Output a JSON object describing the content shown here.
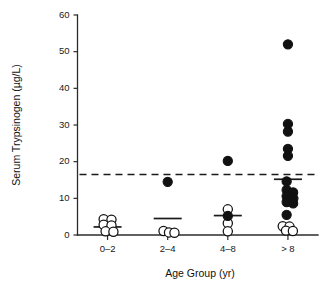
{
  "figure": {
    "width": 330,
    "height": 286,
    "background": "#ffffff",
    "ink_color": "#111111"
  },
  "chart_data": {
    "type": "scatter",
    "title": "",
    "subtitle": "",
    "xlabel": "Age Group (yr)",
    "ylabel": "Serum Trypsinogen (µg/L)",
    "categories": [
      "0–2",
      "2–4",
      "4–8",
      "> 8"
    ],
    "ylim": [
      0,
      60
    ],
    "yticks": [
      0,
      10,
      20,
      30,
      40,
      50,
      60
    ],
    "ytick_labels": [
      "0",
      "10",
      "20",
      "30",
      "40",
      "50",
      "60"
    ],
    "grid": false,
    "legend": "none",
    "marker_styles": {
      "open": "open circle (white fill, black outline)",
      "filled": "filled black circle"
    },
    "annotations": [
      {
        "name": "threshold-line",
        "kind": "horizontal-dashed-line",
        "value": 16.5,
        "style": "dashed",
        "color": "#1a1a1a"
      }
    ],
    "group_means": [
      {
        "category": "0–2",
        "mean": 2.2
      },
      {
        "category": "2–4",
        "mean": 4.5
      },
      {
        "category": "4–8",
        "mean": 5.3
      },
      {
        "category": "> 8",
        "mean": 15.2
      }
    ],
    "series": [
      {
        "name": "0–2",
        "category_index": 0,
        "points": [
          {
            "value": 4.3,
            "marker": "open",
            "jitter": -0.3
          },
          {
            "value": 4.2,
            "marker": "open",
            "jitter": 0.3
          },
          {
            "value": 2.8,
            "marker": "open",
            "jitter": -0.3
          },
          {
            "value": 2.6,
            "marker": "open",
            "jitter": 0.3
          },
          {
            "value": 1.0,
            "marker": "open",
            "jitter": -0.15
          },
          {
            "value": 0.9,
            "marker": "open",
            "jitter": 0.45
          }
        ]
      },
      {
        "name": "2–4",
        "category_index": 1,
        "points": [
          {
            "value": 14.5,
            "marker": "filled",
            "jitter": 0.0
          },
          {
            "value": 1.1,
            "marker": "open",
            "jitter": -0.32
          },
          {
            "value": 0.7,
            "marker": "open",
            "jitter": 0.1
          },
          {
            "value": 0.6,
            "marker": "open",
            "jitter": 0.52
          }
        ]
      },
      {
        "name": "4–8",
        "category_index": 2,
        "points": [
          {
            "value": 20.2,
            "marker": "filled",
            "jitter": 0.0
          },
          {
            "value": 7.0,
            "marker": "open",
            "jitter": 0.0
          },
          {
            "value": 5.2,
            "marker": "filled",
            "jitter": 0.0
          },
          {
            "value": 3.2,
            "marker": "open",
            "jitter": 0.0
          },
          {
            "value": 1.0,
            "marker": "open",
            "jitter": 0.0
          }
        ]
      },
      {
        "name": "> 8",
        "category_index": 3,
        "points": [
          {
            "value": 52.0,
            "marker": "filled",
            "jitter": 0.0
          },
          {
            "value": 30.3,
            "marker": "filled",
            "jitter": 0.0
          },
          {
            "value": 28.2,
            "marker": "filled",
            "jitter": 0.0
          },
          {
            "value": 23.5,
            "marker": "filled",
            "jitter": 0.0
          },
          {
            "value": 21.6,
            "marker": "filled",
            "jitter": 0.0
          },
          {
            "value": 14.6,
            "marker": "filled",
            "jitter": -0.1
          },
          {
            "value": 12.3,
            "marker": "filled",
            "jitter": -0.1
          },
          {
            "value": 11.6,
            "marker": "filled",
            "jitter": 0.4
          },
          {
            "value": 10.6,
            "marker": "filled",
            "jitter": -0.1
          },
          {
            "value": 10.0,
            "marker": "filled",
            "jitter": 0.42
          },
          {
            "value": 9.0,
            "marker": "filled",
            "jitter": -0.1
          },
          {
            "value": 8.6,
            "marker": "filled",
            "jitter": 0.4
          },
          {
            "value": 5.5,
            "marker": "filled",
            "jitter": -0.1
          },
          {
            "value": 2.4,
            "marker": "open",
            "jitter": -0.4
          },
          {
            "value": 2.3,
            "marker": "open",
            "jitter": 0.12
          },
          {
            "value": 1.2,
            "marker": "open",
            "jitter": -0.15
          },
          {
            "value": 1.1,
            "marker": "open",
            "jitter": 0.38
          }
        ]
      }
    ]
  }
}
